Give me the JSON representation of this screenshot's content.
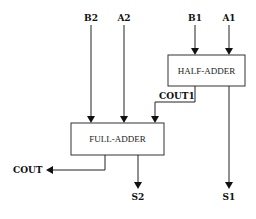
{
  "diagram": {
    "blocks": {
      "half_adder": "HALF-ADDER",
      "full_adder": "FULL-ADDER"
    },
    "inputs": {
      "b2": "B2",
      "a2": "A2",
      "b1": "B1",
      "a1": "A1"
    },
    "signals": {
      "cout1": "COUT1"
    },
    "outputs": {
      "cout": "COUT",
      "s2": "S2",
      "s1": "S1"
    }
  }
}
